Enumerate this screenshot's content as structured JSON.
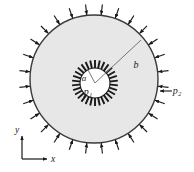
{
  "figure": {
    "kind": "engineering-diagram",
    "width": 194,
    "height": 172,
    "background_color": "#ffffff"
  },
  "geometry": {
    "center_x": 94,
    "center_y": 79,
    "outer_radius": 64,
    "inner_bore_radius": 15,
    "inner_hatch_outer_radius": 23,
    "outer_arrow_count": 28,
    "outer_arrow_length": 11,
    "inner_hatch_count": 30,
    "radius_line_b_angle_deg": -42,
    "radius_line_a_angle_deg": -118,
    "inner_center_x": 95,
    "inner_center_y": 83
  },
  "colors": {
    "wall_fill": "#e7e7e7",
    "bore_fill": "#ffffff",
    "outline": "#3a3a3a",
    "arrow": "#1a1a1a",
    "hatch": "#1a1a1a",
    "label": "#1a1a1a",
    "axis": "#1a1a1a"
  },
  "labels": {
    "inner_radius": {
      "text": "a",
      "x": 84,
      "y": 79
    },
    "outer_radius": {
      "text": "b",
      "x": 136,
      "y": 66
    },
    "internal_pressure": {
      "base": "p",
      "sub": "1",
      "x": 89,
      "y": 93
    },
    "external_pressure": {
      "base": "p",
      "sub": "2",
      "x": 175,
      "y": 94
    }
  },
  "axes": {
    "origin_x": 22,
    "origin_y": 159,
    "y_axis": {
      "label": "y",
      "length": 24,
      "label_x": 17,
      "label_y": 130
    },
    "x_axis": {
      "label": "x",
      "length": 26,
      "label_x": 52,
      "label_y": 163
    }
  }
}
